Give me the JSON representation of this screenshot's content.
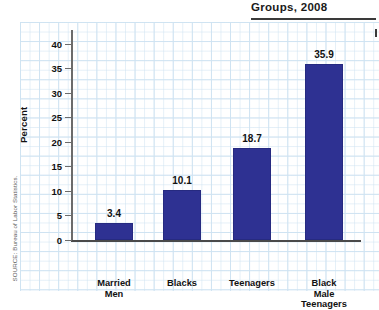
{
  "title": "Groups, 2008",
  "source_note": "SOURCE: Bureau of Labor Statistics.",
  "axis": {
    "ylabel": "Percent",
    "yticks": [
      "0",
      "5",
      "10",
      "15",
      "20",
      "25",
      "30",
      "35",
      "40"
    ]
  },
  "colors": {
    "bar": "#2e3192",
    "grid": "#cfe3f2",
    "axis": "#4a4a4a",
    "text": "#111111"
  },
  "chart_data": {
    "type": "bar",
    "title": "Groups, 2008",
    "xlabel": "",
    "ylabel": "Percent",
    "ylim": [
      0,
      42
    ],
    "ytick_step": 5,
    "grid": true,
    "legend": false,
    "categories": [
      "Married Men",
      "Blacks",
      "Teenagers",
      "Black Male Teenagers"
    ],
    "category_lines": [
      [
        "Married",
        "Men"
      ],
      [
        "Blacks"
      ],
      [
        "Teenagers"
      ],
      [
        "Black",
        "Male",
        "Teenagers"
      ]
    ],
    "values": [
      3.4,
      10.1,
      18.7,
      35.9
    ],
    "value_labels": [
      "3.4",
      "10.1",
      "18.7",
      "35.9"
    ],
    "source": "SOURCE: Bureau of Labor Statistics."
  }
}
